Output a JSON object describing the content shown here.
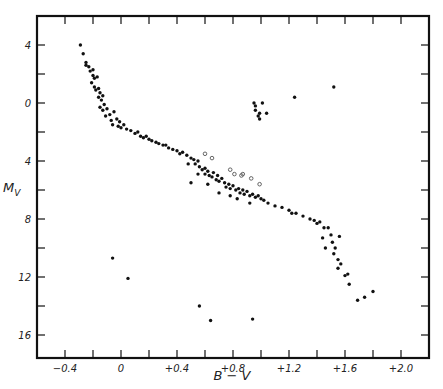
{
  "chart_data": {
    "type": "scatter",
    "title": "",
    "xlabel": "B − V",
    "ylabel": "M_V",
    "xlim": [
      -0.6,
      2.22
    ],
    "ylim": [
      -5.9,
      17.6
    ],
    "y_inverted": true,
    "grid": false,
    "legend": null,
    "x_ticks": [
      {
        "value": -0.4,
        "label": "−0.4"
      },
      {
        "value": -0.2,
        "label": ""
      },
      {
        "value": 0.0,
        "label": "0"
      },
      {
        "value": 0.2,
        "label": ""
      },
      {
        "value": 0.4,
        "label": "+0.4"
      },
      {
        "value": 0.6,
        "label": ""
      },
      {
        "value": 0.8,
        "label": "+0.8"
      },
      {
        "value": 1.0,
        "label": ""
      },
      {
        "value": 1.2,
        "label": "+1.2"
      },
      {
        "value": 1.4,
        "label": ""
      },
      {
        "value": 1.6,
        "label": "+1.6"
      },
      {
        "value": 1.8,
        "label": ""
      },
      {
        "value": 2.0,
        "label": "+2.0"
      }
    ],
    "y_ticks": [
      {
        "value": -4,
        "label": "4"
      },
      {
        "value": -2,
        "label": ""
      },
      {
        "value": 0,
        "label": "0"
      },
      {
        "value": 2,
        "label": ""
      },
      {
        "value": 4,
        "label": "4"
      },
      {
        "value": 6,
        "label": ""
      },
      {
        "value": 8,
        "label": "8"
      },
      {
        "value": 10,
        "label": ""
      },
      {
        "value": 12,
        "label": "12"
      },
      {
        "value": 14,
        "label": ""
      },
      {
        "value": 16,
        "label": "16"
      }
    ],
    "series": [
      {
        "name": "main sequence and giants (filled)",
        "marker": "filled-circle",
        "points": [
          [
            -0.29,
            -4.0
          ],
          [
            -0.27,
            -3.4
          ],
          [
            -0.25,
            -2.8
          ],
          [
            -0.25,
            -2.6
          ],
          [
            -0.23,
            -2.5
          ],
          [
            -0.22,
            -2.2
          ],
          [
            -0.2,
            -2.3
          ],
          [
            -0.2,
            -1.9
          ],
          [
            -0.19,
            -1.7
          ],
          [
            -0.17,
            -1.8
          ],
          [
            -0.21,
            -1.4
          ],
          [
            -0.19,
            -1.1
          ],
          [
            -0.18,
            -0.9
          ],
          [
            -0.16,
            -1.0
          ],
          [
            -0.15,
            -0.7
          ],
          [
            -0.13,
            -0.5
          ],
          [
            -0.16,
            -0.4
          ],
          [
            -0.14,
            -0.2
          ],
          [
            -0.12,
            0.1
          ],
          [
            -0.15,
            0.3
          ],
          [
            -0.13,
            0.5
          ],
          [
            -0.1,
            0.4
          ],
          [
            -0.08,
            0.8
          ],
          [
            -0.11,
            0.9
          ],
          [
            -0.07,
            1.2
          ],
          [
            -0.05,
            0.6
          ],
          [
            -0.03,
            1.1
          ],
          [
            -0.06,
            1.5
          ],
          [
            -0.02,
            1.6
          ],
          [
            0.0,
            1.7
          ],
          [
            0.02,
            1.5
          ],
          [
            0.04,
            1.8
          ],
          [
            -0.01,
            1.3
          ],
          [
            0.07,
            1.9
          ],
          [
            0.1,
            2.1
          ],
          [
            0.12,
            2.0
          ],
          [
            0.14,
            2.3
          ],
          [
            0.16,
            2.4
          ],
          [
            0.18,
            2.3
          ],
          [
            0.2,
            2.5
          ],
          [
            0.22,
            2.6
          ],
          [
            0.25,
            2.7
          ],
          [
            0.27,
            2.8
          ],
          [
            0.3,
            2.9
          ],
          [
            0.32,
            2.9
          ],
          [
            0.34,
            3.1
          ],
          [
            0.37,
            3.2
          ],
          [
            0.4,
            3.3
          ],
          [
            0.42,
            3.5
          ],
          [
            0.44,
            3.4
          ],
          [
            0.47,
            3.6
          ],
          [
            0.5,
            3.8
          ],
          [
            0.52,
            3.9
          ],
          [
            0.53,
            4.2
          ],
          [
            0.55,
            4.0
          ],
          [
            0.56,
            4.4
          ],
          [
            0.58,
            4.6
          ],
          [
            0.6,
            4.5
          ],
          [
            0.6,
            4.9
          ],
          [
            0.62,
            4.7
          ],
          [
            0.63,
            5.0
          ],
          [
            0.65,
            5.1
          ],
          [
            0.66,
            4.8
          ],
          [
            0.68,
            5.3
          ],
          [
            0.69,
            5.0
          ],
          [
            0.7,
            5.4
          ],
          [
            0.72,
            5.2
          ],
          [
            0.74,
            5.5
          ],
          [
            0.75,
            5.8
          ],
          [
            0.77,
            5.6
          ],
          [
            0.78,
            5.9
          ],
          [
            0.8,
            5.7
          ],
          [
            0.82,
            6.0
          ],
          [
            0.84,
            5.9
          ],
          [
            0.85,
            6.2
          ],
          [
            0.87,
            6.0
          ],
          [
            0.88,
            6.3
          ],
          [
            0.9,
            6.1
          ],
          [
            0.92,
            6.4
          ],
          [
            0.94,
            6.3
          ],
          [
            0.96,
            6.5
          ],
          [
            0.98,
            6.4
          ],
          [
            1.0,
            6.6
          ],
          [
            1.02,
            6.7
          ],
          [
            0.55,
            4.9
          ],
          [
            0.7,
            6.2
          ],
          [
            0.83,
            6.6
          ],
          [
            0.62,
            5.6
          ],
          [
            0.48,
            4.2
          ],
          [
            0.5,
            5.5
          ],
          [
            0.78,
            6.4
          ],
          [
            0.92,
            6.9
          ],
          [
            1.05,
            6.9
          ],
          [
            1.1,
            7.1
          ],
          [
            1.15,
            7.2
          ],
          [
            1.2,
            7.4
          ],
          [
            1.22,
            7.6
          ],
          [
            1.25,
            7.6
          ],
          [
            1.3,
            7.8
          ],
          [
            1.35,
            8.0
          ],
          [
            1.38,
            8.1
          ],
          [
            1.4,
            8.3
          ],
          [
            1.42,
            8.2
          ],
          [
            1.45,
            8.6
          ],
          [
            1.48,
            8.6
          ],
          [
            1.5,
            9.1
          ],
          [
            1.51,
            9.6
          ],
          [
            1.53,
            10.0
          ],
          [
            1.52,
            10.4
          ],
          [
            1.55,
            10.8
          ],
          [
            1.57,
            11.1
          ],
          [
            1.55,
            11.4
          ],
          [
            1.6,
            11.9
          ],
          [
            1.62,
            11.8
          ],
          [
            1.63,
            12.5
          ],
          [
            1.44,
            9.3
          ],
          [
            1.74,
            13.4
          ],
          [
            1.8,
            13.0
          ],
          [
            1.69,
            13.6
          ],
          [
            1.46,
            10.0
          ],
          [
            1.56,
            9.2
          ]
        ]
      },
      {
        "name": "giant clump (filled)",
        "marker": "filled-circle",
        "points": [
          [
            0.95,
            0.0
          ],
          [
            0.96,
            0.2
          ],
          [
            1.01,
            0.0
          ],
          [
            0.96,
            0.5
          ],
          [
            0.99,
            0.7
          ],
          [
            1.04,
            0.7
          ],
          [
            0.98,
            0.9
          ],
          [
            0.99,
            1.1
          ],
          [
            1.24,
            -0.4
          ],
          [
            1.52,
            -1.1
          ]
        ]
      },
      {
        "name": "open circles",
        "marker": "open-circle",
        "points": [
          [
            0.6,
            3.5
          ],
          [
            0.65,
            3.8
          ],
          [
            0.78,
            4.6
          ],
          [
            0.81,
            4.9
          ],
          [
            0.86,
            5.0
          ],
          [
            0.87,
            4.9
          ],
          [
            0.93,
            5.2
          ],
          [
            0.99,
            5.6
          ]
        ]
      },
      {
        "name": "white dwarfs (filled)",
        "marker": "filled-circle",
        "points": [
          [
            -0.06,
            10.7
          ],
          [
            0.05,
            12.1
          ],
          [
            0.56,
            14.0
          ],
          [
            0.64,
            15.0
          ],
          [
            0.94,
            14.9
          ]
        ]
      }
    ]
  },
  "axes": {
    "x_title": "B − V",
    "y_title": "M",
    "y_title_sub": "V"
  }
}
